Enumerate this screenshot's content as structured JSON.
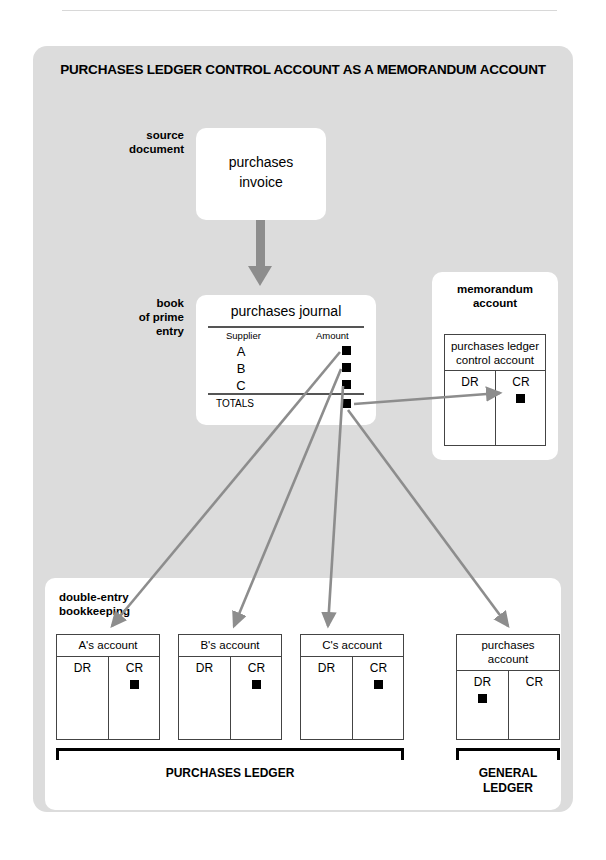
{
  "diagram": {
    "title": "PURCHASES LEDGER CONTROL ACCOUNT AS A MEMORANDUM ACCOUNT",
    "labels": {
      "source_document": "source\ndocument",
      "book_of_prime_entry": "book\nof prime\nentry",
      "memorandum_account": "memorandum\naccount",
      "double_entry_bookkeeping": "double-entry\nbookkeeping"
    },
    "source_document_box": {
      "line1": "purchases",
      "line2": "invoice"
    },
    "journal": {
      "title": "purchases journal",
      "columns": [
        "Supplier",
        "Amount"
      ],
      "rows": [
        {
          "supplier": "A",
          "amount_marker": "filled-square"
        },
        {
          "supplier": "B",
          "amount_marker": "filled-square"
        },
        {
          "supplier": "C",
          "amount_marker": "filled-square"
        }
      ],
      "totals_label": "TOTALS",
      "totals_marker": "filled-square"
    },
    "memorandum": {
      "panel_label": "memorandum\naccount",
      "account_name_line1": "purchases ledger",
      "account_name_line2": "control account",
      "dr_label": "DR",
      "cr_label": "CR",
      "entry_side": "CR"
    },
    "accounts": [
      {
        "name": "A's account",
        "dr_label": "DR",
        "cr_label": "CR",
        "entry_side": "CR"
      },
      {
        "name": "B's account",
        "dr_label": "DR",
        "cr_label": "CR",
        "entry_side": "CR"
      },
      {
        "name": "C's account",
        "dr_label": "DR",
        "cr_label": "CR",
        "entry_side": "CR"
      },
      {
        "name": "purchases\naccount",
        "dr_label": "DR",
        "cr_label": "CR",
        "entry_side": "DR"
      }
    ],
    "brackets": [
      {
        "label": "PURCHASES LEDGER"
      },
      {
        "label": "GENERAL\nLEDGER"
      }
    ],
    "colors": {
      "panel_background": "#dcdcdc",
      "box_background": "#ffffff",
      "arrow": "#8d8d8d",
      "marker": "#000000",
      "rule": "#555555"
    }
  }
}
